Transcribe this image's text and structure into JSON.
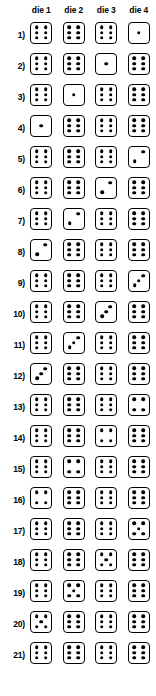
{
  "table": {
    "row_label_suffix": ")",
    "headers": [
      "die 1",
      "die 2",
      "die 3",
      "die 4"
    ],
    "rows": [
      {
        "label": "1)",
        "values": [
          6,
          6,
          6,
          1
        ]
      },
      {
        "label": "2)",
        "values": [
          6,
          6,
          1,
          6
        ]
      },
      {
        "label": "3)",
        "values": [
          6,
          1,
          6,
          6
        ]
      },
      {
        "label": "4)",
        "values": [
          1,
          6,
          6,
          6
        ]
      },
      {
        "label": "5)",
        "values": [
          6,
          6,
          6,
          2
        ]
      },
      {
        "label": "6)",
        "values": [
          6,
          6,
          2,
          6
        ]
      },
      {
        "label": "7)",
        "values": [
          6,
          2,
          6,
          6
        ]
      },
      {
        "label": "8)",
        "values": [
          2,
          6,
          6,
          6
        ]
      },
      {
        "label": "9)",
        "values": [
          6,
          6,
          6,
          3
        ]
      },
      {
        "label": "10)",
        "values": [
          6,
          6,
          3,
          6
        ]
      },
      {
        "label": "11)",
        "values": [
          6,
          3,
          6,
          6
        ]
      },
      {
        "label": "12)",
        "values": [
          3,
          6,
          6,
          6
        ]
      },
      {
        "label": "13)",
        "values": [
          6,
          6,
          6,
          4
        ]
      },
      {
        "label": "14)",
        "values": [
          6,
          6,
          4,
          6
        ]
      },
      {
        "label": "15)",
        "values": [
          6,
          4,
          6,
          6
        ]
      },
      {
        "label": "16)",
        "values": [
          4,
          6,
          6,
          6
        ]
      },
      {
        "label": "17)",
        "values": [
          6,
          6,
          6,
          5
        ]
      },
      {
        "label": "18)",
        "values": [
          6,
          6,
          5,
          6
        ]
      },
      {
        "label": "19)",
        "values": [
          6,
          5,
          6,
          6
        ]
      },
      {
        "label": "20)",
        "values": [
          5,
          6,
          6,
          6
        ]
      },
      {
        "label": "21)",
        "values": [
          6,
          6,
          6,
          6
        ]
      }
    ]
  },
  "style": {
    "pip_color": "#000000",
    "die_border_color": "#000000",
    "background": "#ffffff"
  },
  "pip_layouts": {
    "1": [
      "p-mc"
    ],
    "2": [
      "p-dbl",
      "p-dtr"
    ],
    "3": [
      "p-dbl",
      "p-dc",
      "p-dtr"
    ],
    "4": [
      "p-tl",
      "p-tr",
      "p-bl",
      "p-br"
    ],
    "5": [
      "p-tl",
      "p-tr",
      "p-mc",
      "p-bl",
      "p-br"
    ],
    "6": [
      "p-tl",
      "p-tr",
      "p-ml",
      "p-mr",
      "p-bl",
      "p-br"
    ]
  }
}
